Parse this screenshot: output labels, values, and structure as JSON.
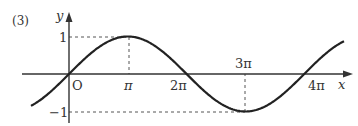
{
  "problem_label": "(3)",
  "chart_data": {
    "type": "line",
    "title": "",
    "function": "y = sin(x/2)",
    "xlabel": "x",
    "ylabel": "y",
    "origin_label": "O",
    "x_ticks": [
      {
        "value": 3.14159,
        "label": "π"
      },
      {
        "value": 6.28319,
        "label": "2π"
      },
      {
        "value": 9.42478,
        "label": "3π"
      },
      {
        "value": 12.56637,
        "label": "4π"
      }
    ],
    "y_ticks": [
      {
        "value": 1,
        "label": "1"
      },
      {
        "value": -1,
        "label": "-1"
      }
    ],
    "key_points": [
      {
        "x": 0,
        "y": 0
      },
      {
        "x": 3.14159,
        "y": 1
      },
      {
        "x": 6.28319,
        "y": 0
      },
      {
        "x": 9.42478,
        "y": -1
      },
      {
        "x": 12.56637,
        "y": 0
      }
    ],
    "xlim": [
      -2.6,
      14.7
    ],
    "ylim": [
      -1.2,
      1.3
    ],
    "guides": [
      {
        "from": [
          0,
          1
        ],
        "to": [
          3.14159,
          1
        ],
        "style": "dashed"
      },
      {
        "from": [
          3.14159,
          1
        ],
        "to": [
          3.14159,
          0
        ],
        "style": "dashed"
      },
      {
        "from": [
          0,
          -1
        ],
        "to": [
          9.42478,
          -1
        ],
        "style": "dashed"
      },
      {
        "from": [
          9.42478,
          -1
        ],
        "to": [
          9.42478,
          0
        ],
        "style": "dashed"
      }
    ],
    "grid": false,
    "legend": null
  },
  "labels": {
    "y": "y",
    "x": "x",
    "origin": "O",
    "one": "1",
    "neg_one": "−1",
    "pi": "π",
    "two_pi": "2π",
    "three_pi": "3π",
    "four_pi": "4π"
  }
}
